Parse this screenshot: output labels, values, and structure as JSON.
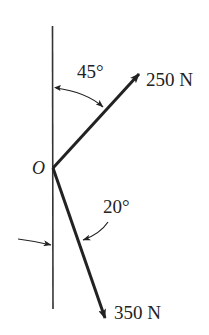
{
  "diagram": {
    "type": "force-diagram",
    "colors": {
      "stroke": "#222222",
      "background": "#ffffff"
    },
    "origin": {
      "label": "O"
    },
    "reference_line": {
      "orientation": "vertical"
    },
    "forces": [
      {
        "label": "250 N",
        "magnitude": 250,
        "unit": "N",
        "angle_from_vertical_deg": 45,
        "direction": "up-right"
      },
      {
        "label": "350 N",
        "magnitude": 350,
        "unit": "N",
        "angle_from_vertical_deg": 20,
        "direction": "down-right"
      }
    ],
    "angles": [
      {
        "label": "45°",
        "value": 45,
        "between": "vertical line and 250 N force"
      },
      {
        "label": "20°",
        "value": 20,
        "between": "vertical line and 350 N force"
      }
    ]
  }
}
